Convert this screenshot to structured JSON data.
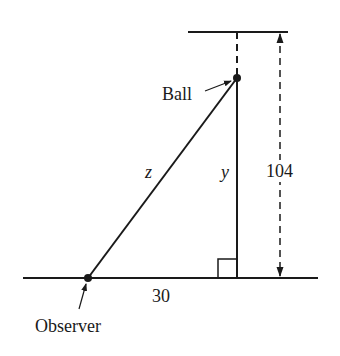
{
  "diagram": {
    "labels": {
      "ball": "Ball",
      "observer": "Observer",
      "hypotenuse": "z",
      "vertical": "y",
      "height": "104",
      "base": "30"
    },
    "colors": {
      "stroke": "#1a1a1a",
      "background": "#ffffff"
    }
  }
}
